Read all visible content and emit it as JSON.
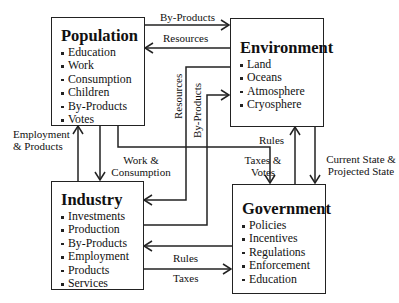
{
  "diagram": {
    "nodes": {
      "population": {
        "title": "Population",
        "items": [
          "Education",
          "Work",
          "Consumption",
          "Children",
          "By-Products",
          "Votes"
        ]
      },
      "environment": {
        "title": "Environment",
        "items": [
          "Land",
          "Oceans",
          "Atmosphere",
          "Cryosphere"
        ]
      },
      "industry": {
        "title": "Industry",
        "items": [
          "Investments",
          "Production",
          "By-Products",
          "Employment",
          "Products",
          "Services"
        ]
      },
      "government": {
        "title": "Government",
        "items": [
          "Policies",
          "Incentives",
          "Regulations",
          "Enforcement",
          "Education"
        ]
      }
    },
    "edges": {
      "pop_to_env": {
        "label": "By-Products",
        "from": "Population",
        "to": "Environment"
      },
      "env_to_pop": {
        "label": "Resources",
        "from": "Environment",
        "to": "Population"
      },
      "env_to_ind": {
        "label": "Resources",
        "from": "Environment",
        "to": "Industry"
      },
      "ind_to_env": {
        "label": "By-Products",
        "from": "Industry",
        "to": "Environment"
      },
      "ind_to_pop": {
        "label_line1": "Employment",
        "label_line2": "& Products",
        "from": "Industry",
        "to": "Population"
      },
      "pop_to_ind": {
        "label_line1": "Work &",
        "label_line2": "Consumption",
        "from": "Population",
        "to": "Industry"
      },
      "pop_to_gov": {
        "label_line1": "Taxes &",
        "label_line2": "Votes",
        "from": "Population",
        "to": "Government"
      },
      "gov_to_env": {
        "label": "Rules",
        "from": "Government",
        "to": "Environment"
      },
      "env_to_gov": {
        "label_line1": "Current State &",
        "label_line2": "Projected State",
        "from": "Environment",
        "to": "Government"
      },
      "gov_to_ind": {
        "label": "Rules",
        "from": "Government",
        "to": "Industry"
      },
      "ind_to_gov": {
        "label": "Taxes",
        "from": "Industry",
        "to": "Government"
      }
    }
  }
}
